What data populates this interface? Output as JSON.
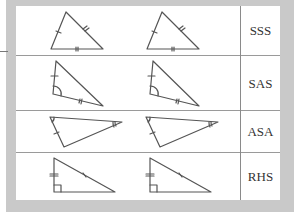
{
  "diagram": {
    "rows": [
      {
        "label": "SSS",
        "y": 0,
        "h": 50
      },
      {
        "label": "SAS",
        "y": 50,
        "h": 55
      },
      {
        "label": "ASA",
        "y": 105,
        "h": 42
      },
      {
        "label": "RHS",
        "y": 147,
        "h": 47
      }
    ],
    "colors": {
      "frame": "#c9c9c9",
      "line": "#555555",
      "divider": "#9a9a9a"
    }
  }
}
